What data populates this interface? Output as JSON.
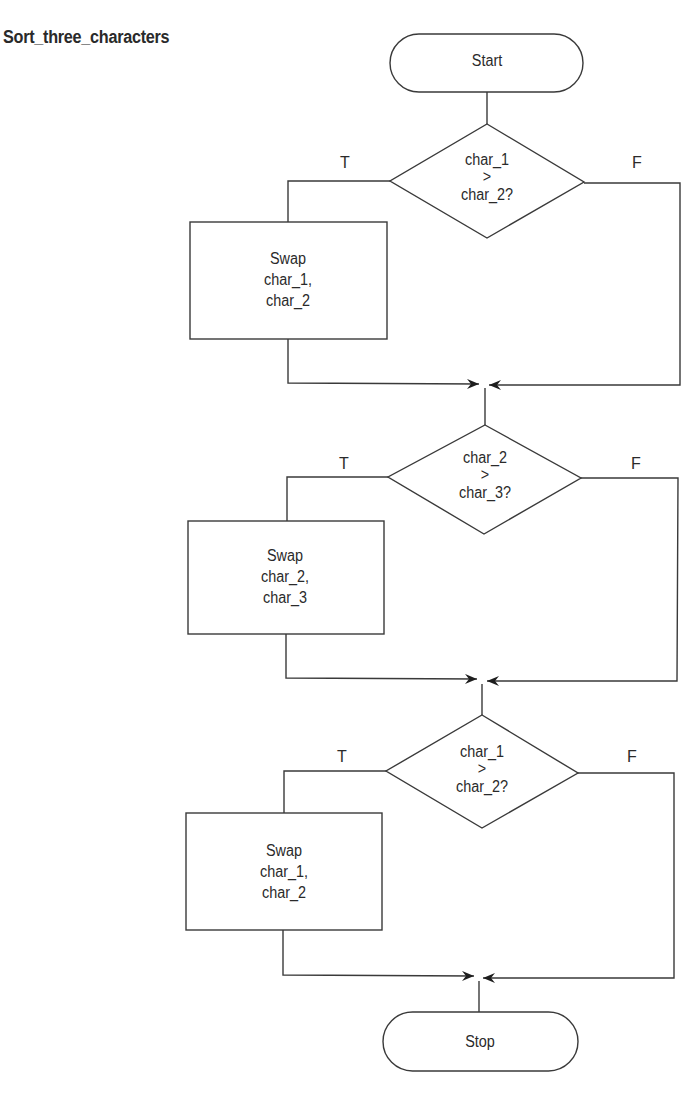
{
  "title": "Sort_three_characters",
  "terminals": {
    "start": "Start",
    "stop": "Stop"
  },
  "decisions": [
    {
      "line1": "char_1",
      "op": ">",
      "line2": "char_2?",
      "true_label": "T",
      "false_label": "F"
    },
    {
      "line1": "char_2",
      "op": ">",
      "line2": "char_3?",
      "true_label": "T",
      "false_label": "F"
    },
    {
      "line1": "char_1",
      "op": ">",
      "line2": "char_2?",
      "true_label": "T",
      "false_label": "F"
    }
  ],
  "processes": [
    {
      "line1": "Swap",
      "line2": "char_1,",
      "line3": "char_2"
    },
    {
      "line1": "Swap",
      "line2": "char_2,",
      "line3": "char_3"
    },
    {
      "line1": "Swap",
      "line2": "char_1,",
      "line3": "char_2"
    }
  ],
  "colors": {
    "stroke": "#3a3a3a",
    "text": "#2a2a2a",
    "background": "#ffffff"
  }
}
